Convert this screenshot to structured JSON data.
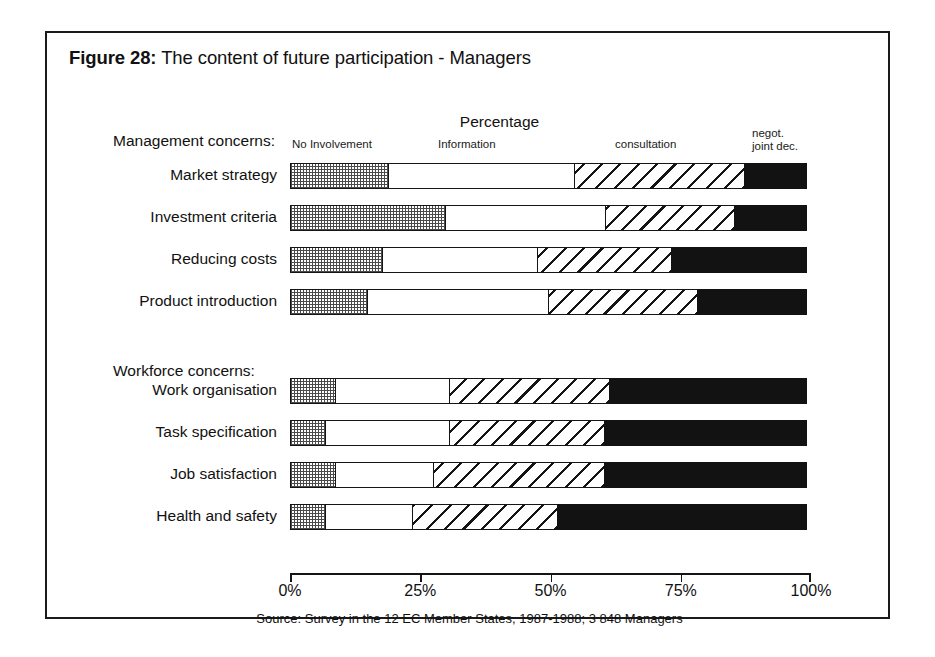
{
  "figure": {
    "number_label": "Figure 28:",
    "title": "The content of future participation - Managers",
    "percentage_caption": "Percentage",
    "source_note": "Source: Survey in the 12 EC Member States, 1987-1988; 3 848 Managers"
  },
  "column_headers": {
    "no_involvement": "No Involvement",
    "information": "Information",
    "consultation": "consultation",
    "negot_line1": "negot.",
    "negot_line2": "joint dec."
  },
  "groups": {
    "management": "Management concerns:",
    "workforce": "Workforce concerns:"
  },
  "axis": {
    "ticks": [
      "0%",
      "25%",
      "50%",
      "75%",
      "100%"
    ],
    "tick_values": [
      0,
      25,
      50,
      75,
      100
    ],
    "min": 0,
    "max": 100
  },
  "chart_data": {
    "type": "bar",
    "orientation": "horizontal",
    "stacked": true,
    "normalized_percent": true,
    "title": "Figure 28: The content of future participation - Managers",
    "subtitle": "Percentage",
    "xlabel": "Percentage",
    "ylabel": "",
    "xlim": [
      0,
      100
    ],
    "xticks": [
      0,
      25,
      50,
      75,
      100
    ],
    "xticklabels": [
      "0%",
      "25%",
      "50%",
      "75%",
      "100%"
    ],
    "grid": false,
    "legend_position": "top-inline-column-headers",
    "annotation": "Source: Survey in the 12 EC Member States, 1987-1988; 3 848 Managers",
    "series": [
      {
        "name": "No Involvement",
        "pattern": "dotted-grid",
        "values": [
          19,
          30,
          18,
          15,
          9,
          7,
          9,
          7
        ]
      },
      {
        "name": "Information",
        "pattern": "white",
        "values": [
          36,
          31,
          30,
          35,
          22,
          24,
          19,
          17
        ]
      },
      {
        "name": "consultation",
        "pattern": "diagonal-hatch",
        "values": [
          33,
          25,
          26,
          29,
          31,
          30,
          33,
          28
        ]
      },
      {
        "name": "negot. joint dec.",
        "pattern": "solid-black",
        "values": [
          12,
          14,
          26,
          21,
          38,
          39,
          39,
          48
        ]
      }
    ],
    "categories": [
      "Market strategy",
      "Investment criteria",
      "Reducing costs",
      "Product introduction",
      "Work organisation",
      "Task specification",
      "Job satisfaction",
      "Health and safety"
    ],
    "category_groups": [
      {
        "group": "Management concerns:",
        "categories": [
          "Market strategy",
          "Investment criteria",
          "Reducing costs",
          "Product introduction"
        ]
      },
      {
        "group": "Workforce concerns:",
        "categories": [
          "Work organisation",
          "Task specification",
          "Job satisfaction",
          "Health and safety"
        ]
      }
    ]
  },
  "rows": [
    {
      "label": "Market strategy",
      "top": 130,
      "segments": [
        19,
        36,
        33,
        12
      ]
    },
    {
      "label": "Investment criteria",
      "top": 172,
      "segments": [
        30,
        31,
        25,
        14
      ]
    },
    {
      "label": "Reducing costs",
      "top": 214,
      "segments": [
        18,
        30,
        26,
        26
      ]
    },
    {
      "label": "Product introduction",
      "top": 256,
      "segments": [
        15,
        35,
        29,
        21
      ]
    },
    {
      "label": "Work organisation",
      "top": 345,
      "segments": [
        9,
        22,
        31,
        38
      ]
    },
    {
      "label": "Task specification",
      "top": 387,
      "segments": [
        7,
        24,
        30,
        39
      ]
    },
    {
      "label": "Job satisfaction",
      "top": 429,
      "segments": [
        9,
        19,
        33,
        39
      ]
    },
    {
      "label": "Health and safety",
      "top": 471,
      "segments": [
        7,
        17,
        28,
        48
      ]
    }
  ],
  "colors": {
    "ink": "#151515",
    "paper": "#ffffff",
    "solid_black": "#121212",
    "dot_grey": "#4a4a4a"
  }
}
